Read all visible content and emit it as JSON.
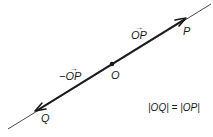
{
  "diagram": {
    "colors": {
      "line": "#1a1a1a",
      "background": "#ffffff"
    },
    "points": {
      "O": {
        "label": "O"
      },
      "P": {
        "label": "P"
      },
      "Q": {
        "label": "Q"
      }
    },
    "vectors": {
      "op": {
        "prefix": "",
        "text": "OP",
        "arrow": "→"
      },
      "neg_op": {
        "prefix": "−",
        "text": "OP",
        "arrow": "→"
      }
    },
    "equation": "|OQ| = |OP|"
  }
}
